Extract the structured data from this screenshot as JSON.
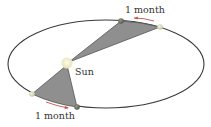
{
  "diagram": {
    "labels": {
      "sun": "Sun",
      "top_interval": "1 month",
      "bottom_interval": "1 month"
    },
    "colors": {
      "orbit": "#3a3a3a",
      "sector_fill": "#8f8f8f",
      "sector_stroke": "#555555",
      "sun": "#f3efc8",
      "planet_dark": "#6b6b5e",
      "planet_light": "#d8d6b8",
      "arrow": "#c0504d"
    }
  }
}
